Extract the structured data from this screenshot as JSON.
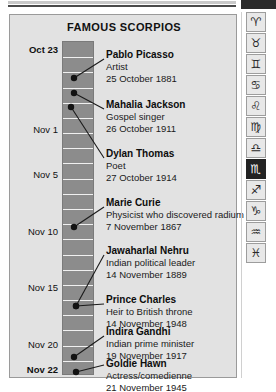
{
  "panel": {
    "title": "FAMOUS SCORPIOS"
  },
  "timeline": {
    "start_label": "Oct 23",
    "end_label": "Nov 22",
    "axis_ticks": [
      {
        "label": "Oct 23",
        "bold": true,
        "y": 30
      },
      {
        "label": "Nov 1",
        "bold": false,
        "y": 110
      },
      {
        "label": "Nov 5",
        "bold": false,
        "y": 155
      },
      {
        "label": "Nov 10",
        "bold": false,
        "y": 212
      },
      {
        "label": "Nov 15",
        "bold": false,
        "y": 268
      },
      {
        "label": "Nov 20",
        "bold": false,
        "y": 325
      },
      {
        "label": "Nov 22",
        "bold": true,
        "y": 350
      }
    ]
  },
  "people": [
    {
      "name": "Pablo Picasso",
      "role": "Artist",
      "date": "25 October 1881",
      "text_y": 34,
      "dot_x": 64,
      "dot_y": 63,
      "line_x2": 94,
      "line_y2": 44
    },
    {
      "name": "Mahalia Jackson",
      "role": "Gospel singer",
      "date": "26 October 1911",
      "text_y": 84,
      "dot_x": 64,
      "dot_y": 78,
      "line_x2": 94,
      "line_y2": 94
    },
    {
      "name": "Dylan Thomas",
      "role": "Poet",
      "date": "27 October 1914",
      "text_y": 133,
      "dot_x": 61,
      "dot_y": 92,
      "line_x2": 94,
      "line_y2": 143
    },
    {
      "name": "Marie Curie",
      "role": "Physicist who discovered radium",
      "date": "7 November 1867",
      "text_y": 182,
      "dot_x": 64,
      "dot_y": 212,
      "line_x2": 94,
      "line_y2": 192
    },
    {
      "name": "Jawaharlal Nehru",
      "role": "Indian political leader",
      "date": "14 November 1889",
      "text_y": 230,
      "dot_x": 66,
      "dot_y": 291,
      "line_x2": 94,
      "line_y2": 240
    },
    {
      "name": "Prince Charles",
      "role": "Heir to British throne",
      "date": "14 November 1948",
      "text_y": 279,
      "dot_x": 66,
      "dot_y": 291,
      "line_x2": 94,
      "line_y2": 289
    },
    {
      "name": "Indira Gandhi",
      "role": "Indian prime minister",
      "date": "19 November 1917",
      "text_y": 311,
      "dot_x": 64,
      "dot_y": 342,
      "line_x2": 94,
      "line_y2": 321
    },
    {
      "name": "Goldie Hawn",
      "role": "Actress/comedienne",
      "date": "21 November 1945",
      "text_y": 343,
      "dot_x": 66,
      "dot_y": 357,
      "line_x2": 94,
      "line_y2": 350
    }
  ],
  "zodiac_rail": {
    "items": [
      {
        "name": "aries-icon",
        "glyph": "♈",
        "selected": false
      },
      {
        "name": "taurus-icon",
        "glyph": "♉",
        "selected": false
      },
      {
        "name": "gemini-icon",
        "glyph": "♊",
        "selected": false
      },
      {
        "name": "cancer-icon",
        "glyph": "♋",
        "selected": false
      },
      {
        "name": "leo-icon",
        "glyph": "♌",
        "selected": false
      },
      {
        "name": "virgo-icon",
        "glyph": "♍",
        "selected": false
      },
      {
        "name": "libra-icon",
        "glyph": "♎",
        "selected": false
      },
      {
        "name": "scorpio-icon",
        "glyph": "♏",
        "selected": true
      },
      {
        "name": "sagittarius-icon",
        "glyph": "♐",
        "selected": false
      },
      {
        "name": "capricorn-icon",
        "glyph": "♑",
        "selected": false
      },
      {
        "name": "aquarius-icon",
        "glyph": "♒",
        "selected": false
      },
      {
        "name": "pisces-icon",
        "glyph": "♓",
        "selected": false
      }
    ]
  },
  "colors": {
    "panel_bg": "#e2e2e2",
    "ladder_fill": "#8c8c8c",
    "accent_dark": "#2b2b2b"
  }
}
